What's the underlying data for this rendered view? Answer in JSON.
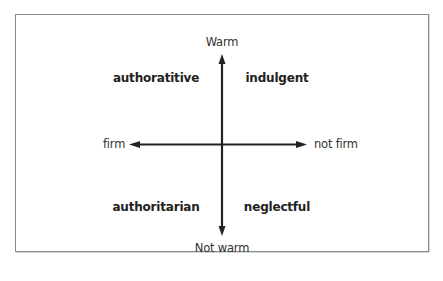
{
  "diagram": {
    "axes": {
      "top": "Warm",
      "bottom": "Not warm",
      "left": "firm",
      "right": "not firm"
    },
    "quadrants": {
      "top_left": "authoratitive",
      "top_right": "indulgent",
      "bottom_left": "authoritarian",
      "bottom_right": "neglectful"
    },
    "colors": {
      "arrow": "#222222",
      "border": "#8a8a8a",
      "background": "#ffffff"
    }
  }
}
